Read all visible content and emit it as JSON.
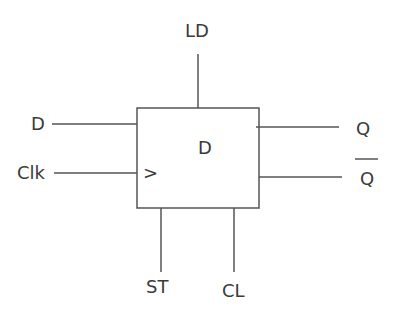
{
  "diagram": {
    "block_label": "D",
    "clock_symbol": ">",
    "inputs_left": [
      "D",
      "Clk"
    ],
    "input_top": "LD",
    "inputs_bottom": [
      "ST",
      "CL"
    ],
    "outputs_right": [
      "Q",
      "Q"
    ],
    "output_bar": "Q-bar",
    "line_color": "#555555"
  }
}
